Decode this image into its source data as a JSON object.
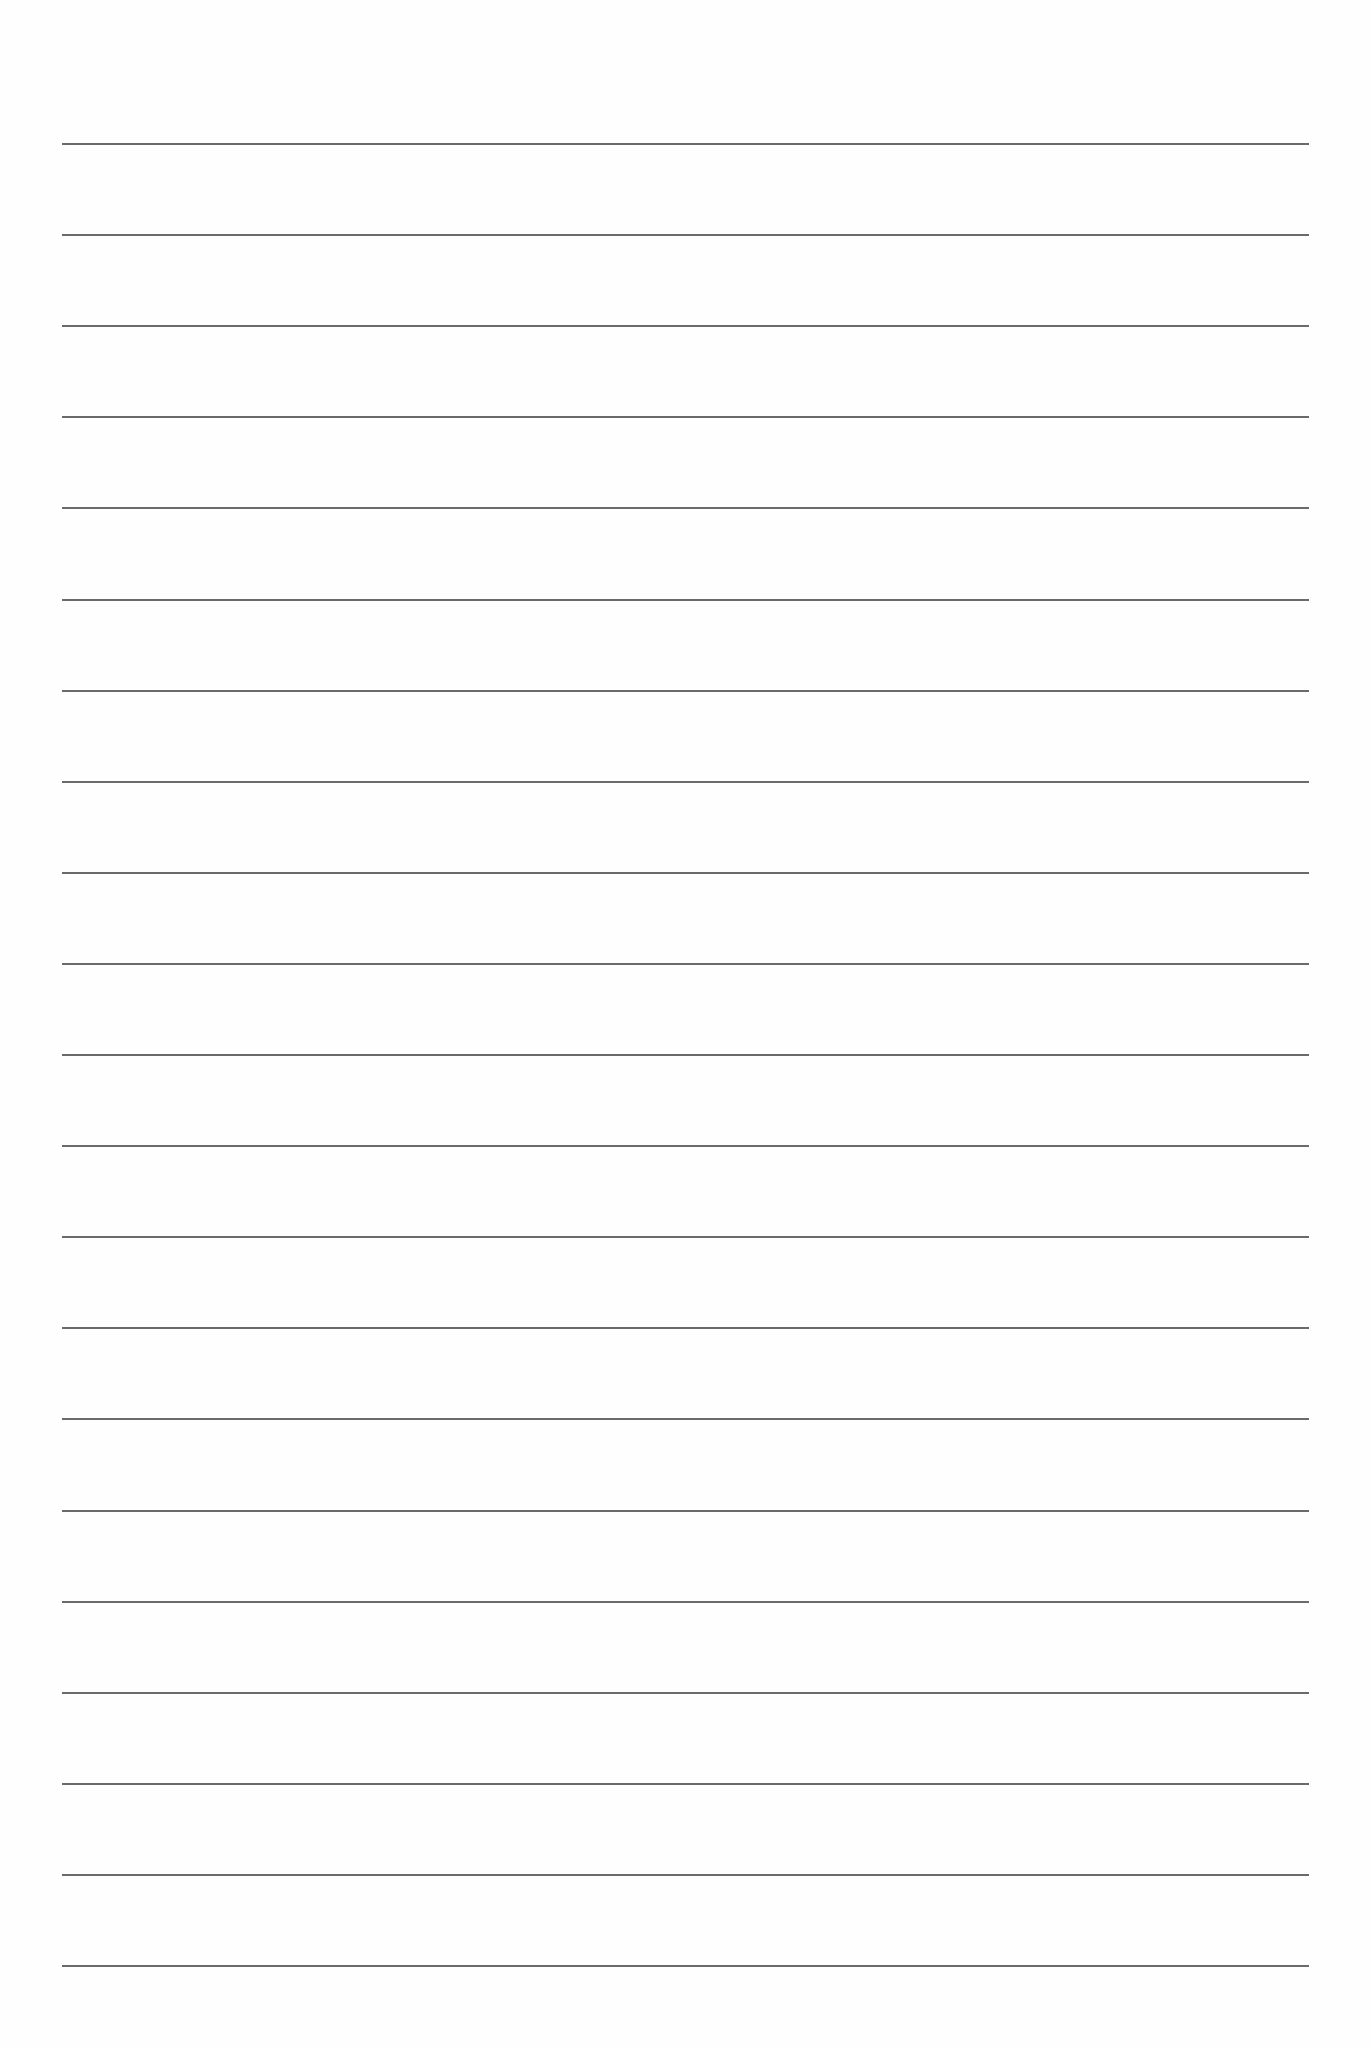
{
  "document": {
    "type": "lined-paper",
    "background_color": "#fefefe",
    "rule_color": "#555555",
    "rules": {
      "count": 21,
      "first_y": 144,
      "last_y": 1966,
      "spacing": 91.1,
      "left_x": 62,
      "right_x": 1309
    }
  }
}
